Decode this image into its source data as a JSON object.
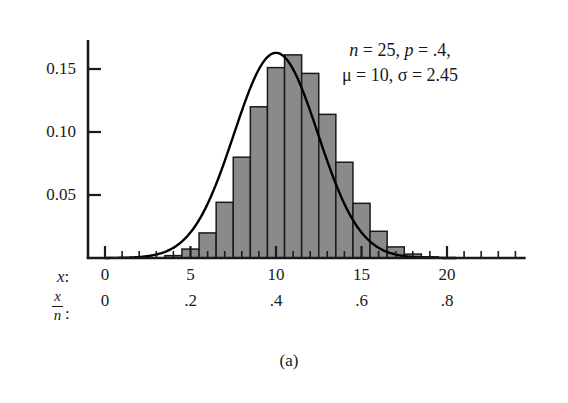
{
  "figure": {
    "caption": "(a)",
    "annotation_line1_parts": {
      "n_sym": "n",
      "n_val": " = 25, ",
      "p_sym": "p",
      "p_val": " = .4,"
    },
    "annotation_line2_parts": {
      "mu_sym": "μ",
      "mu_val": " = 10, ",
      "sigma_sym": "σ",
      "sigma_val": " = 2.45"
    },
    "annotation_line1": "n = 25, p = .4,",
    "annotation_line2": "μ = 10, σ = 2.45"
  },
  "axes": {
    "y_tick_labels": [
      "0.15",
      "0.10",
      "0.05"
    ],
    "x_row1_key": "x:",
    "x_row1_key_symbol": "x",
    "x_row2_key_num": "x",
    "x_row2_key_den": "n",
    "x_row2_key_colon": ":",
    "x_row1_labels": [
      "0",
      "5",
      "10",
      "15",
      "20"
    ],
    "x_row2_labels": [
      "0",
      ".2",
      ".4",
      ".6",
      ".8"
    ]
  },
  "colors": {
    "bar_fill": "#8a8a8a",
    "bar_stroke": "#1a1a1a",
    "curve": "#000000",
    "axis": "#1a1a1a",
    "background": "#ffffff"
  },
  "chart_data": {
    "type": "bar",
    "title": "",
    "subtitle": "",
    "xlabel": "x",
    "ylabel": "",
    "grid": false,
    "legend": "none",
    "annotations": [
      "n = 25, p = .4,",
      "μ = 10, σ = 2.45",
      "(a)"
    ],
    "distribution": "binomial",
    "parameters": {
      "n": 25,
      "p": 0.4,
      "mu": 10,
      "sigma": 2.45
    },
    "xlim": [
      -0.5,
      24.5
    ],
    "ylim": [
      0,
      0.175
    ],
    "y_ticks": [
      0.05,
      0.1,
      0.15
    ],
    "x_ticks": [
      0,
      5,
      10,
      15,
      20
    ],
    "x_secondary_ticks": [
      0,
      0.2,
      0.4,
      0.6,
      0.8
    ],
    "categories": [
      0,
      1,
      2,
      3,
      4,
      5,
      6,
      7,
      8,
      9,
      10,
      11,
      12,
      13,
      14,
      15,
      16,
      17,
      18,
      19,
      20,
      21,
      22,
      23,
      24,
      25
    ],
    "values": [
      0.0,
      0.0,
      0.0001,
      0.0004,
      0.0019,
      0.0071,
      0.0199,
      0.0442,
      0.08,
      0.12,
      0.1511,
      0.1612,
      0.1465,
      0.114,
      0.076,
      0.0434,
      0.0212,
      0.0088,
      0.0031,
      0.0009,
      0.0002,
      0.0,
      0.0,
      0.0,
      0.0,
      0.0
    ],
    "series": [
      {
        "name": "Binomial pmf (n = 25, p = .4)",
        "type": "bar",
        "values": [
          0.0,
          0.0,
          0.0001,
          0.0004,
          0.0019,
          0.0071,
          0.0199,
          0.0442,
          0.08,
          0.12,
          0.1511,
          0.1612,
          0.1465,
          0.114,
          0.076,
          0.0434,
          0.0212,
          0.0088,
          0.0031,
          0.0009,
          0.0002,
          0.0,
          0.0,
          0.0,
          0.0,
          0.0
        ]
      },
      {
        "name": "Normal approximation (μ = 10, σ = 2.45)",
        "type": "line",
        "mu": 10,
        "sigma": 2.45,
        "peak": 0.1628
      }
    ]
  }
}
